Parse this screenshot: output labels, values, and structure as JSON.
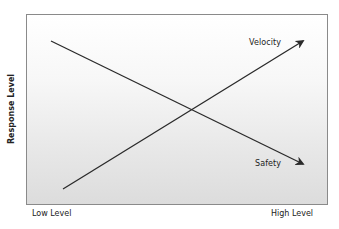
{
  "diagram": {
    "y_axis_label": "Response Level",
    "x_axis_labels": {
      "low": "Low Level",
      "high": "High Level"
    },
    "series": [
      {
        "name": "Velocity",
        "direction": "increasing",
        "start": {
          "x": "Low Level",
          "y": "low"
        },
        "end": {
          "x": "High Level",
          "y": "high"
        },
        "has_arrowhead": true
      },
      {
        "name": "Safety",
        "direction": "decreasing",
        "start": {
          "x": "Low Level",
          "y": "high"
        },
        "end": {
          "x": "High Level",
          "y": "low"
        },
        "has_arrowhead": true
      }
    ],
    "colors": {
      "line": "#2a2a2a",
      "border": "#8a8a8a",
      "background_top": "#ffffff",
      "background_bottom": "#dcdcdc"
    }
  },
  "labels": {
    "velocity": "Velocity",
    "safety": "Safety"
  }
}
